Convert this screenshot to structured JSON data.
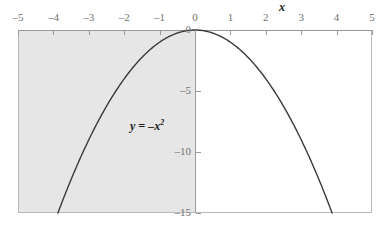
{
  "chart_data": {
    "type": "line",
    "title": "",
    "subtitle": "",
    "xlabel": "x",
    "ylabel": "",
    "equation_label": "y = –x",
    "equation_exponent": "2",
    "function": "y = -x^2",
    "xlim": [
      -5,
      5
    ],
    "ylim": [
      -15,
      0
    ],
    "grid": false,
    "legend": null,
    "x_ticks": [
      -5,
      -4,
      -3,
      -2,
      -1,
      0,
      1,
      2,
      3,
      4,
      5
    ],
    "x_tick_labels": [
      "–5",
      "–4",
      "–3",
      "–2",
      "–1",
      "0",
      "1",
      "2",
      "3",
      "4",
      "5"
    ],
    "y_ticks": [
      0,
      -5,
      -10,
      -15
    ],
    "y_tick_labels": [
      "0",
      "–5",
      "–10",
      "–15"
    ],
    "x_axis_position": "top",
    "y_axis_position": "x=0",
    "shaded_region": {
      "description": "left half plane x < 0",
      "x_from": -5,
      "x_to": 0,
      "color": "#e6e6e6"
    },
    "series": [
      {
        "name": "y = -x^2",
        "color": "#3a3a3a",
        "x": [
          -3.873,
          -3.6,
          -3.2,
          -2.8,
          -2.4,
          -2.0,
          -1.6,
          -1.2,
          -0.8,
          -0.4,
          0,
          0.4,
          0.8,
          1.2,
          1.6,
          2.0,
          2.4,
          2.8,
          3.2,
          3.6,
          3.873
        ],
        "values": [
          -15,
          -12.96,
          -10.24,
          -7.84,
          -5.76,
          -4.0,
          -2.56,
          -1.44,
          -0.64,
          -0.16,
          0,
          -0.16,
          -0.64,
          -1.44,
          -2.56,
          -4.0,
          -5.76,
          -7.84,
          -10.24,
          -12.96,
          -15
        ]
      }
    ],
    "colors": {
      "curve": "#3a3a3a",
      "axis": "#9a9a9a",
      "frame": "#b9b9b9",
      "shade": "#e6e6e6",
      "tick_text": "#6f6f6f",
      "annotation": "#1b1b1b",
      "background": "#ffffff"
    }
  }
}
